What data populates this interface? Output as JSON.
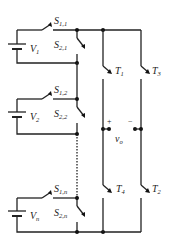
{
  "diagram": {
    "type": "cascaded H-bridge multilevel inverter schematic",
    "colors": {
      "wire": "#222222",
      "background": "#ffffff"
    },
    "cells": [
      {
        "source": {
          "main": "V",
          "sub": "1"
        },
        "switch_top": {
          "main": "S",
          "sub": "1,1"
        },
        "switch_bottom": {
          "main": "S",
          "sub": "2,1"
        }
      },
      {
        "source": {
          "main": "V",
          "sub": "2"
        },
        "switch_top": {
          "main": "S",
          "sub": "1,2"
        },
        "switch_bottom": {
          "main": "S",
          "sub": "2,2"
        }
      },
      {
        "source": {
          "main": "V",
          "sub": "n"
        },
        "switch_top": {
          "main": "S",
          "sub": "1,n"
        },
        "switch_bottom": {
          "main": "S",
          "sub": "2,n"
        }
      }
    ],
    "bridge_switches": [
      {
        "main": "T",
        "sub": "1"
      },
      {
        "main": "T",
        "sub": "3"
      },
      {
        "main": "T",
        "sub": "4"
      },
      {
        "main": "T",
        "sub": "2"
      }
    ],
    "output": {
      "plus": "+",
      "minus": "−",
      "label_main": "v",
      "label_sub": "o"
    }
  }
}
